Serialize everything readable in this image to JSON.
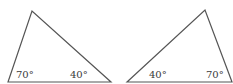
{
  "diagram": {
    "stroke_color": "#555555",
    "triangles": [
      {
        "name": "left-triangle",
        "vertices": [
          [
            8,
            82
          ],
          [
            32,
            11
          ],
          [
            111,
            82
          ]
        ],
        "angles": [
          {
            "label": "70°",
            "x": 16,
            "y": 78
          },
          {
            "label": "40°",
            "x": 70,
            "y": 78
          }
        ]
      },
      {
        "name": "right-triangle",
        "vertices": [
          [
            127,
            82
          ],
          [
            205,
            10
          ],
          [
            232,
            82
          ]
        ],
        "angles": [
          {
            "label": "40°",
            "x": 149,
            "y": 78
          },
          {
            "label": "70°",
            "x": 206,
            "y": 78
          }
        ]
      }
    ]
  }
}
